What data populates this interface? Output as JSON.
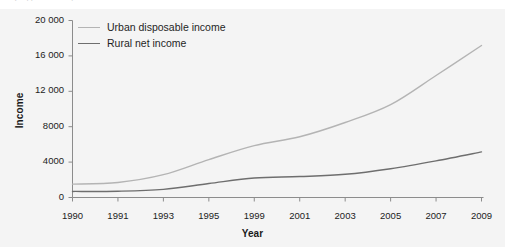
{
  "top_strip": {
    "cropped_text": "(cropped text row)"
  },
  "chart_data": {
    "type": "line",
    "title": "",
    "subtitle": "",
    "xlabel": "Year",
    "ylabel": "Income",
    "categories": [
      "1990",
      "1991",
      "1993",
      "1995",
      "1999",
      "2001",
      "2003",
      "2005",
      "2007",
      "2009"
    ],
    "x_tick_labels": [
      "1990",
      "1991",
      "1993",
      "1995",
      "1999",
      "2001",
      "2003",
      "2005",
      "2007",
      "2009"
    ],
    "y_tick_labels": [
      "0",
      "4000",
      "8000",
      "12 000",
      "16 000",
      "20 000"
    ],
    "y_tick_values": [
      0,
      4000,
      8000,
      12000,
      16000,
      20000
    ],
    "ylim": [
      0,
      20000
    ],
    "grid": false,
    "legend_position": "upper left",
    "series": [
      {
        "name": "Urban disposable income",
        "color": "#b4b4b4",
        "values": [
          1510,
          1700,
          2577,
          4283,
          5854,
          6860,
          8472,
          10493,
          13786,
          17175
        ]
      },
      {
        "name": "Rural net income",
        "color": "#6e6e6e",
        "values": [
          686,
          709,
          922,
          1578,
          2210,
          2366,
          2622,
          3255,
          4140,
          5153
        ]
      }
    ]
  },
  "style": {
    "background": "#f4f4f4",
    "axis_color": "#8c8c8c",
    "text_color": "#222222"
  }
}
